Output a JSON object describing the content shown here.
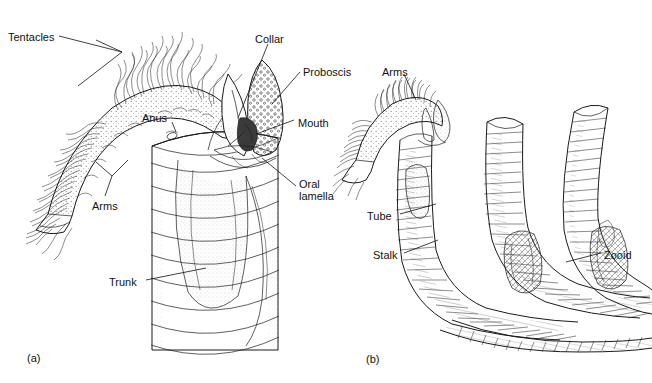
{
  "figure": {
    "background_color": "#ffffff",
    "ink_color": "#1a1a1a",
    "panels": [
      {
        "id": "a",
        "caption": "(a)",
        "caption_x": 27,
        "caption_y": 352,
        "description": "Detailed single zooid extending from its tube, showing tentacle-bearing arms, proboscis, collar and trunk",
        "labels": [
          {
            "name": "tentacles",
            "text": "Tentacles",
            "x": 8,
            "y": 31,
            "leader": "two-pronged"
          },
          {
            "name": "anus",
            "text": "Anus",
            "x": 142,
            "y": 112,
            "leader": "single"
          },
          {
            "name": "arms",
            "text": "Arms",
            "x": 92,
            "y": 200,
            "leader": "two-pronged"
          },
          {
            "name": "trunk",
            "text": "Trunk",
            "x": 109,
            "y": 276,
            "leader": "single"
          },
          {
            "name": "collar",
            "text": "Collar",
            "x": 255,
            "y": 33,
            "leader": "single"
          },
          {
            "name": "proboscis",
            "text": "Proboscis",
            "x": 303,
            "y": 66,
            "leader": "single"
          },
          {
            "name": "mouth",
            "text": "Mouth",
            "x": 298,
            "y": 117,
            "leader": "single"
          },
          {
            "name": "oral-lamella",
            "text": "Oral\nlamella",
            "x": 299,
            "y": 178,
            "leader": "single"
          }
        ]
      },
      {
        "id": "b",
        "caption": "(b)",
        "caption_x": 366,
        "caption_y": 353,
        "description": "Colony of three annulated tubes joined at a common basal stolon, one zooid extended",
        "labels": [
          {
            "name": "arms",
            "text": "Arms",
            "x": 382,
            "y": 66,
            "leader": "single"
          },
          {
            "name": "tube",
            "text": "Tube",
            "x": 367,
            "y": 210,
            "leader": "single"
          },
          {
            "name": "stalk",
            "text": "Stalk",
            "x": 373,
            "y": 249,
            "leader": "single"
          },
          {
            "name": "zooid",
            "text": "Zooid",
            "x": 604,
            "y": 249,
            "leader": "single"
          }
        ],
        "tube_count": 3
      }
    ]
  }
}
